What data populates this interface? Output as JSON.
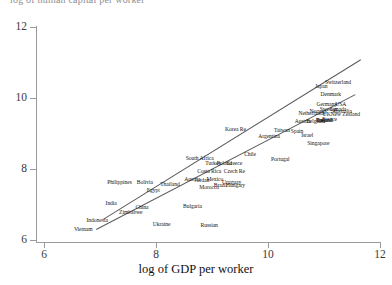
{
  "title_clipped": "log of human capital per worker",
  "axes": {
    "x_label": "log of GDP per worker",
    "y_label": "",
    "x_ticks": [
      6,
      8,
      10,
      12
    ],
    "y_ticks": [
      6,
      8,
      10,
      12
    ],
    "xlim": [
      6,
      12
    ],
    "ylim": [
      6,
      12
    ]
  },
  "chart_data": {
    "type": "scatter",
    "title": "log of human capital per worker",
    "xlabel": "log of GDP per worker",
    "ylabel": "",
    "xlim": [
      6,
      12
    ],
    "ylim": [
      6,
      12
    ],
    "x_ticks": [
      6,
      8,
      10,
      12
    ],
    "y_ticks": [
      6,
      8,
      10,
      12
    ],
    "grid": false,
    "legend": "none",
    "point_style": "text-labels-only",
    "points": [
      {
        "label": "Vietnam",
        "x": 6.7,
        "y": 6.3
      },
      {
        "label": "Indonesia",
        "x": 6.95,
        "y": 6.55
      },
      {
        "label": "Zimbabwe",
        "x": 7.55,
        "y": 6.8
      },
      {
        "label": "India",
        "x": 7.2,
        "y": 7.05
      },
      {
        "label": "China",
        "x": 7.75,
        "y": 6.92
      },
      {
        "label": "Ukraine",
        "x": 8.1,
        "y": 6.45
      },
      {
        "label": "Russian",
        "x": 8.95,
        "y": 6.42
      },
      {
        "label": "Bulgaria",
        "x": 8.65,
        "y": 6.95
      },
      {
        "label": "Egypt",
        "x": 7.95,
        "y": 7.42
      },
      {
        "label": "Philippines",
        "x": 7.35,
        "y": 7.62
      },
      {
        "label": "Bolivia",
        "x": 7.8,
        "y": 7.62
      },
      {
        "label": "Thailand",
        "x": 8.25,
        "y": 7.58
      },
      {
        "label": "Austria",
        "x": 8.65,
        "y": 7.72
      },
      {
        "label": "Jordan",
        "x": 8.82,
        "y": 7.7
      },
      {
        "label": "Mexico",
        "x": 9.05,
        "y": 7.72
      },
      {
        "label": "Morocco",
        "x": 8.95,
        "y": 7.5
      },
      {
        "label": "Brazil",
        "x": 9.15,
        "y": 7.55
      },
      {
        "label": "Uruguay",
        "x": 9.35,
        "y": 7.62
      },
      {
        "label": "Hungary",
        "x": 9.42,
        "y": 7.55
      },
      {
        "label": "Costa Rica",
        "x": 8.95,
        "y": 7.95
      },
      {
        "label": "Czech Re",
        "x": 9.4,
        "y": 7.95
      },
      {
        "label": "South Africa",
        "x": 8.78,
        "y": 8.3
      },
      {
        "label": "Turkey",
        "x": 9.02,
        "y": 8.18
      },
      {
        "label": "Poland",
        "x": 9.22,
        "y": 8.18
      },
      {
        "label": "Greece",
        "x": 9.4,
        "y": 8.18
      },
      {
        "label": "Chile",
        "x": 9.68,
        "y": 8.42
      },
      {
        "label": "Portugal",
        "x": 10.22,
        "y": 8.28
      },
      {
        "label": "Korea Re",
        "x": 9.42,
        "y": 9.12
      },
      {
        "label": "Taiwan",
        "x": 10.25,
        "y": 9.1
      },
      {
        "label": "Spain",
        "x": 10.52,
        "y": 9.08
      },
      {
        "label": "Argentina",
        "x": 10.02,
        "y": 8.92
      },
      {
        "label": "Israel",
        "x": 10.7,
        "y": 8.95
      },
      {
        "label": "Singapore",
        "x": 10.9,
        "y": 8.72
      },
      {
        "label": "Ireland",
        "x": 11.02,
        "y": 9.38
      },
      {
        "label": "Finland",
        "x": 11.0,
        "y": 9.38
      },
      {
        "label": "Austria",
        "x": 10.62,
        "y": 9.35
      },
      {
        "label": "Belgium",
        "x": 10.85,
        "y": 9.35
      },
      {
        "label": "Italy",
        "x": 10.95,
        "y": 9.38
      },
      {
        "label": "France",
        "x": 11.1,
        "y": 9.42
      },
      {
        "label": "UK",
        "x": 11.05,
        "y": 9.55
      },
      {
        "label": "Netherlands",
        "x": 10.78,
        "y": 9.58
      },
      {
        "label": "Norway",
        "x": 10.9,
        "y": 9.62
      },
      {
        "label": "Sweden",
        "x": 11.08,
        "y": 9.68
      },
      {
        "label": "Canada",
        "x": 11.25,
        "y": 9.7
      },
      {
        "label": "Australia",
        "x": 11.32,
        "y": 9.62
      },
      {
        "label": "New Zealand",
        "x": 11.38,
        "y": 9.55
      },
      {
        "label": "USA",
        "x": 11.3,
        "y": 9.82
      },
      {
        "label": "Germany",
        "x": 11.05,
        "y": 9.82
      },
      {
        "label": "Denmark",
        "x": 11.12,
        "y": 10.12
      },
      {
        "label": "Japan",
        "x": 10.95,
        "y": 10.35
      },
      {
        "label": "Switzerland",
        "x": 11.25,
        "y": 10.45
      }
    ],
    "lines": [
      {
        "name": "upper-line",
        "x0": 7.05,
        "y0": 6.6,
        "x1": 11.65,
        "y1": 11.1
      },
      {
        "name": "lower-line",
        "x0": 6.92,
        "y0": 6.3,
        "x1": 11.55,
        "y1": 10.1
      }
    ]
  }
}
